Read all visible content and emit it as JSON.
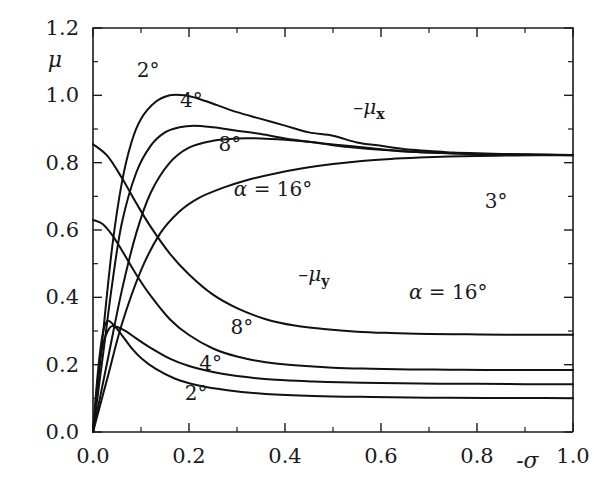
{
  "chart_data": {
    "type": "line",
    "title": "",
    "xlabel": "-σ",
    "ylabel": "μ",
    "xlim": [
      0.0,
      1.0
    ],
    "ylim": [
      0.0,
      1.2
    ],
    "grid": false,
    "legend": "none",
    "xticks": [
      "0.0",
      "0.2",
      "0.4",
      "0.6",
      "0.8",
      "1.0"
    ],
    "xtick_values": [
      0.0,
      0.2,
      0.4,
      0.6,
      0.8,
      1.0
    ],
    "yticks": [
      "0.0",
      "0.2",
      "0.4",
      "0.6",
      "0.8",
      "1.0",
      "1.2"
    ],
    "ytick_values": [
      0.0,
      0.2,
      0.4,
      0.6,
      0.8,
      1.0,
      1.2
    ],
    "x_minor_step": 0.1,
    "y_minor_step": 0.1,
    "series": [
      {
        "name": "-μ_x, α = 2°",
        "label": "2°",
        "group": "mu_x",
        "alpha_deg": 2,
        "x": [
          0.0,
          0.02,
          0.04,
          0.06,
          0.08,
          0.1,
          0.13,
          0.16,
          0.19,
          0.22,
          0.26,
          0.3,
          0.35,
          0.4,
          0.45,
          0.5,
          0.55,
          0.6,
          0.65,
          0.7,
          0.75,
          0.8,
          0.85,
          0.9,
          0.95,
          1.0
        ],
        "values": [
          0.0,
          0.28,
          0.55,
          0.74,
          0.86,
          0.93,
          0.98,
          1.0,
          1.0,
          0.99,
          0.97,
          0.95,
          0.93,
          0.91,
          0.89,
          0.88,
          0.86,
          0.85,
          0.84,
          0.835,
          0.83,
          0.828,
          0.826,
          0.825,
          0.824,
          0.823
        ]
      },
      {
        "name": "-μ_x, α = 4°",
        "label": "4°",
        "group": "mu_x",
        "alpha_deg": 4,
        "x": [
          0.0,
          0.02,
          0.04,
          0.06,
          0.09,
          0.12,
          0.15,
          0.18,
          0.21,
          0.25,
          0.3,
          0.35,
          0.4,
          0.45,
          0.5,
          0.55,
          0.6,
          0.65,
          0.7,
          0.75,
          0.8,
          0.85,
          0.9,
          0.95,
          1.0
        ],
        "values": [
          0.0,
          0.22,
          0.44,
          0.62,
          0.77,
          0.85,
          0.89,
          0.905,
          0.91,
          0.905,
          0.895,
          0.885,
          0.872,
          0.862,
          0.852,
          0.844,
          0.838,
          0.833,
          0.83,
          0.828,
          0.826,
          0.825,
          0.824,
          0.823,
          0.823
        ]
      },
      {
        "name": "-μ_x, α = 8°",
        "label": "8°",
        "group": "mu_x",
        "alpha_deg": 8,
        "x": [
          0.0,
          0.03,
          0.06,
          0.09,
          0.12,
          0.16,
          0.2,
          0.25,
          0.3,
          0.35,
          0.4,
          0.45,
          0.5,
          0.55,
          0.6,
          0.65,
          0.7,
          0.75,
          0.8,
          0.85,
          0.9,
          0.95,
          1.0
        ],
        "values": [
          0.0,
          0.21,
          0.42,
          0.59,
          0.71,
          0.8,
          0.845,
          0.865,
          0.872,
          0.872,
          0.868,
          0.862,
          0.854,
          0.847,
          0.84,
          0.834,
          0.83,
          0.827,
          0.825,
          0.824,
          0.823,
          0.823,
          0.822
        ]
      },
      {
        "name": "-μ_x, α = 16°",
        "label": "α = 16°",
        "group": "mu_x",
        "alpha_deg": 16,
        "x": [
          0.0,
          0.03,
          0.06,
          0.1,
          0.14,
          0.18,
          0.22,
          0.27,
          0.32,
          0.38,
          0.44,
          0.5,
          0.56,
          0.62,
          0.68,
          0.74,
          0.8,
          0.86,
          0.92,
          1.0
        ],
        "values": [
          0.0,
          0.16,
          0.32,
          0.48,
          0.59,
          0.655,
          0.695,
          0.725,
          0.748,
          0.768,
          0.784,
          0.796,
          0.805,
          0.811,
          0.815,
          0.818,
          0.82,
          0.821,
          0.822,
          0.822
        ]
      },
      {
        "name": "-μ_y, α = 16°",
        "label": "α = 16°",
        "group": "mu_y",
        "alpha_deg": 16,
        "x": [
          0.0,
          0.03,
          0.06,
          0.09,
          0.12,
          0.16,
          0.2,
          0.25,
          0.3,
          0.36,
          0.42,
          0.48,
          0.55,
          0.62,
          0.7,
          0.78,
          0.86,
          0.94,
          1.0
        ],
        "values": [
          0.855,
          0.82,
          0.755,
          0.68,
          0.61,
          0.53,
          0.468,
          0.408,
          0.368,
          0.335,
          0.316,
          0.306,
          0.298,
          0.294,
          0.291,
          0.29,
          0.289,
          0.289,
          0.289
        ]
      },
      {
        "name": "-μ_y, α = 8°",
        "label": "8°",
        "group": "mu_y",
        "alpha_deg": 8,
        "x": [
          0.0,
          0.02,
          0.04,
          0.06,
          0.09,
          0.12,
          0.16,
          0.2,
          0.25,
          0.3,
          0.36,
          0.42,
          0.5,
          0.58,
          0.66,
          0.74,
          0.82,
          0.9,
          1.0
        ],
        "values": [
          0.63,
          0.618,
          0.585,
          0.54,
          0.468,
          0.405,
          0.335,
          0.288,
          0.248,
          0.224,
          0.207,
          0.198,
          0.191,
          0.188,
          0.186,
          0.185,
          0.184,
          0.184,
          0.184
        ]
      },
      {
        "name": "-μ_y, α = 4°",
        "label": "4°",
        "group": "mu_y",
        "alpha_deg": 4,
        "x": [
          0.0,
          0.01,
          0.02,
          0.035,
          0.05,
          0.07,
          0.09,
          0.12,
          0.16,
          0.2,
          0.25,
          0.3,
          0.38,
          0.46,
          0.56,
          0.68,
          0.8,
          0.9,
          1.0
        ],
        "values": [
          0.0,
          0.155,
          0.255,
          0.31,
          0.312,
          0.298,
          0.278,
          0.25,
          0.218,
          0.196,
          0.178,
          0.166,
          0.155,
          0.15,
          0.146,
          0.144,
          0.143,
          0.142,
          0.142
        ]
      },
      {
        "name": "-μ_y, α = 2°",
        "label": "2°",
        "group": "mu_y",
        "alpha_deg": 2,
        "x": [
          0.0,
          0.01,
          0.02,
          0.03,
          0.045,
          0.06,
          0.08,
          0.1,
          0.13,
          0.17,
          0.22,
          0.28,
          0.36,
          0.46,
          0.58,
          0.7,
          0.82,
          0.92,
          1.0
        ],
        "values": [
          0.0,
          0.175,
          0.29,
          0.33,
          0.315,
          0.288,
          0.25,
          0.22,
          0.188,
          0.159,
          0.138,
          0.124,
          0.113,
          0.107,
          0.104,
          0.102,
          0.101,
          0.101,
          0.1
        ]
      }
    ],
    "annotations": [
      {
        "text": "2°",
        "x": 0.115,
        "y": 1.055,
        "name": "label-mux-2deg"
      },
      {
        "text": "4°",
        "x": 0.205,
        "y": 0.965,
        "name": "label-mux-4deg"
      },
      {
        "text": "8°",
        "x": 0.285,
        "y": 0.835,
        "name": "label-mux-8deg"
      },
      {
        "text": "α = 16°",
        "x": 0.375,
        "y": 0.7,
        "name": "label-mux-16deg"
      },
      {
        "text": "-μ_x",
        "x": 0.575,
        "y": 0.945,
        "name": "label-mux-curve-family"
      },
      {
        "text": "3°",
        "x": 0.84,
        "y": 0.665,
        "name": "label-3deg"
      },
      {
        "text": "-μ_y",
        "x": 0.46,
        "y": 0.45,
        "name": "label-muy-curve-family"
      },
      {
        "text": "α = 16°",
        "x": 0.74,
        "y": 0.395,
        "name": "label-muy-16deg"
      },
      {
        "text": "8°",
        "x": 0.31,
        "y": 0.29,
        "name": "label-muy-8deg"
      },
      {
        "text": "4°",
        "x": 0.245,
        "y": 0.185,
        "name": "label-muy-4deg"
      },
      {
        "text": "2°",
        "x": 0.215,
        "y": 0.095,
        "name": "label-muy-2deg"
      }
    ]
  },
  "axes": {
    "y_title": "μ",
    "x_title_prefix": "-",
    "x_title_symbol": "σ"
  },
  "colors": {
    "ink": "#1b1b1b",
    "curve": "#111111",
    "background": "#ffffff"
  }
}
